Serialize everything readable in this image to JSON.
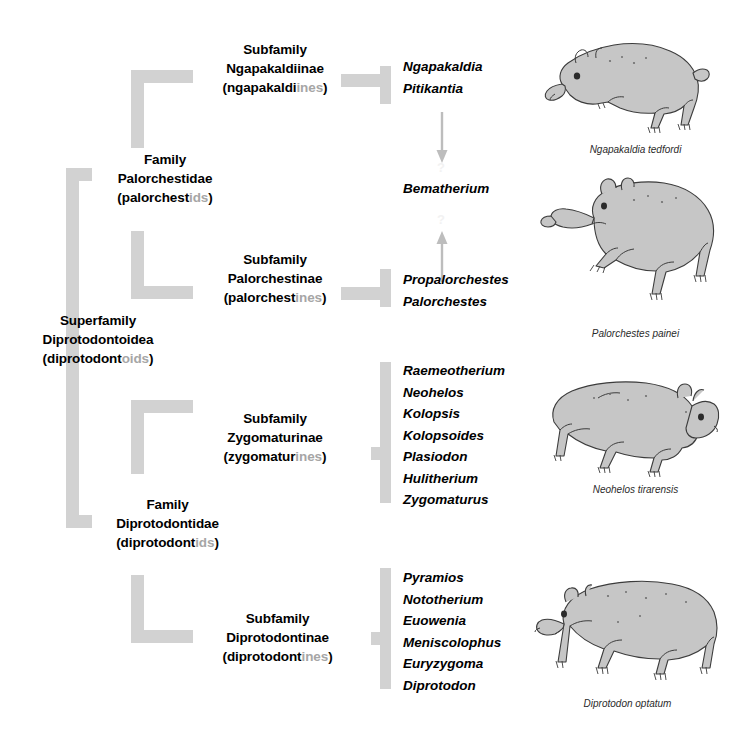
{
  "figure": {
    "colors": {
      "bracket_gray": "#d2d2d2",
      "vernacular_gray": "#a6a6a6",
      "arrow_gray": "#b8b8b8",
      "animal_fill": "#c4c4c4",
      "animal_outline": "#3a3a3a",
      "text_black": "#000000",
      "background": "#ffffff"
    }
  },
  "taxa": {
    "superfamily": {
      "rank": "Superfamily",
      "name": "Diprotodontoidea",
      "vernacular_open": "(",
      "vernacular_stem": "diprotodont",
      "vernacular_suffix": "oids",
      "vernacular_close": ")"
    },
    "families": [
      {
        "rank": "Family",
        "name": "Palorchestidae",
        "vernacular_open": "(",
        "vernacular_stem": "palorchest",
        "vernacular_suffix": "ids",
        "vernacular_close": ")"
      },
      {
        "rank": "Family",
        "name": "Diprotodontidae",
        "vernacular_open": "(",
        "vernacular_stem": "diprotodont",
        "vernacular_suffix": "ids",
        "vernacular_close": ")"
      }
    ],
    "subfamilies": [
      {
        "rank": "Subfamily",
        "name": "Ngapakaldiinae",
        "vernacular_open": "(",
        "vernacular_stem": "ngapakaldi",
        "vernacular_suffix": "ines",
        "vernacular_close": ")",
        "genera": [
          "Ngapakaldia",
          "Pitikantia"
        ]
      },
      {
        "rank": "Subfamily",
        "name": "Palorchestinae",
        "vernacular_open": "(",
        "vernacular_stem": "palorchest",
        "vernacular_suffix": "ines",
        "vernacular_close": ")",
        "genera": [
          "Propalorchestes",
          "Palorchestes"
        ]
      },
      {
        "rank": "Subfamily",
        "name": "Zygomaturinae",
        "vernacular_open": "(",
        "vernacular_stem": "zygomatur",
        "vernacular_suffix": "ines",
        "vernacular_close": ")",
        "genera": [
          "Raemeotherium",
          "Neohelos",
          "Kolopsis",
          "Kolopsoides",
          "Plasiodon",
          "Hulitherium",
          "Zygomaturus"
        ]
      },
      {
        "rank": "Subfamily",
        "name": "Diprotodontinae",
        "vernacular_open": "(",
        "vernacular_stem": "diprotodont",
        "vernacular_suffix": "ines",
        "vernacular_close": ")",
        "genera": [
          "Pyramios",
          "Nototherium",
          "Euowenia",
          "Meniscolophus",
          "Euryzygoma",
          "Diprotodon"
        ]
      }
    ],
    "incertae_sedis": {
      "genus": "Bematherium",
      "uncertainty_marker": "?",
      "relation_note": "linked by two uncertain arrows"
    }
  },
  "illustrations": [
    {
      "caption": "Ngapakaldia tedfordi",
      "animal": "ngapakaldia"
    },
    {
      "caption": "Palorchestes painei",
      "animal": "palorchestes"
    },
    {
      "caption": "Neohelos tirarensis",
      "animal": "neohelos"
    },
    {
      "caption": "Diprotodon optatum",
      "animal": "diprotodon"
    }
  ]
}
